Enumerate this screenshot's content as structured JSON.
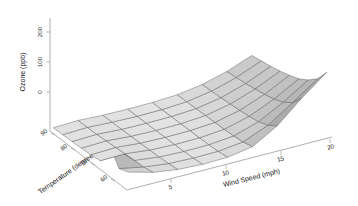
{
  "figure": {
    "title": "",
    "background_color": "#ffffff",
    "surface_fill_light": "#e2e2e2",
    "surface_fill_mid": "#c4c4c4",
    "surface_fill_dark": "#8f8f8f",
    "mesh_line_color": "#5a5a5a",
    "axis_color": "#8c8c8c"
  },
  "chart_data": {
    "type": "surface",
    "title": "",
    "zlabel": "Ozone (ppb)",
    "xlabel": "Wind Speed (mph)",
    "ylabel": "Temperature (degrees F)",
    "z_ticks": [
      0,
      100,
      200
    ],
    "zlim": [
      -20,
      230
    ],
    "x_ticks": [
      5,
      10,
      15,
      20
    ],
    "xlim": [
      2,
      21
    ],
    "y_ticks": [
      90,
      80,
      70,
      60
    ],
    "ylim": [
      56,
      97
    ],
    "grid": true,
    "legend": false,
    "projection": {
      "theta": -35,
      "phi": 22,
      "shade": 0.6,
      "border_color": "#5a5a5a"
    },
    "x": [
      2.3,
      4.6,
      6.9,
      9.2,
      11.5,
      13.8,
      16.1,
      18.4,
      20.7
    ],
    "y": [
      57,
      62,
      67,
      72,
      77,
      82,
      87,
      92,
      97
    ],
    "z": [
      [
        52,
        30,
        18,
        14,
        16,
        30,
        78,
        150,
        214
      ],
      [
        40,
        24,
        14,
        11,
        12,
        22,
        56,
        110,
        168
      ],
      [
        96,
        22,
        12,
        9,
        10,
        18,
        44,
        88,
        140
      ],
      [
        18,
        20,
        11,
        8,
        9,
        16,
        38,
        74,
        120
      ],
      [
        14,
        17,
        10,
        8,
        9,
        15,
        34,
        66,
        108
      ],
      [
        12,
        15,
        9,
        7,
        8,
        14,
        31,
        60,
        98
      ],
      [
        10,
        13,
        8,
        7,
        8,
        13,
        28,
        54,
        90
      ],
      [
        9,
        12,
        8,
        6,
        7,
        12,
        26,
        50,
        84
      ],
      [
        8,
        11,
        7,
        6,
        7,
        11,
        24,
        46,
        78
      ]
    ],
    "annotations": [
      {
        "text": "sharp ridge / fold at low wind speed and low temperature"
      }
    ]
  },
  "axes": {
    "z": {
      "label": "Ozone (ppb)",
      "ticks": [
        "0",
        "100",
        "200"
      ]
    },
    "x": {
      "label": "Wind Speed (mph)",
      "ticks": [
        "5",
        "10",
        "15",
        "20"
      ]
    },
    "y": {
      "label": "Temperature (degrees F)",
      "ticks": [
        "90",
        "80",
        "70",
        "60"
      ]
    }
  }
}
